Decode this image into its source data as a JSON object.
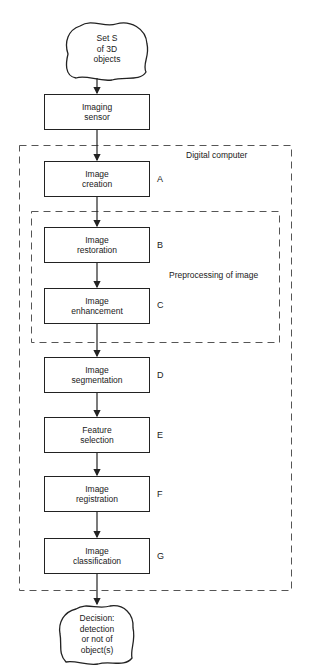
{
  "diagram": {
    "type": "flowchart",
    "start_node": {
      "lines": [
        "Set S",
        "of 3D",
        "objects"
      ]
    },
    "sensor": {
      "lines": [
        "Imaging",
        "sensor"
      ]
    },
    "regions": {
      "digital_computer": "Digital computer",
      "preprocessing": "Preprocessing of image"
    },
    "steps": [
      {
        "tag": "A",
        "lines": [
          "Image",
          "creation"
        ]
      },
      {
        "tag": "B",
        "lines": [
          "Image",
          "restoration"
        ]
      },
      {
        "tag": "C",
        "lines": [
          "Image",
          "enhancement"
        ]
      },
      {
        "tag": "D",
        "lines": [
          "Image",
          "segmentation"
        ]
      },
      {
        "tag": "E",
        "lines": [
          "Feature",
          "selection"
        ]
      },
      {
        "tag": "F",
        "lines": [
          "Image",
          "registration"
        ]
      },
      {
        "tag": "G",
        "lines": [
          "Image",
          "classification"
        ]
      }
    ],
    "end_node": {
      "lines": [
        "Decision:",
        "detection",
        "or not of",
        "object(s)"
      ]
    },
    "colors": {
      "stroke": "#222222",
      "dash": "#555555",
      "background": "#ffffff"
    }
  }
}
